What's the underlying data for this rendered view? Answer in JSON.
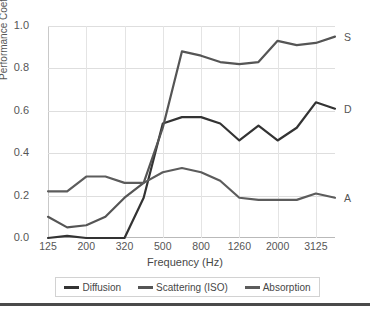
{
  "chart_data": {
    "type": "line",
    "title": "",
    "xlabel": "Frequency (Hz)",
    "ylabel": "Performance Coefficient",
    "ylim": [
      0.0,
      1.0
    ],
    "yticks": [
      "0.0",
      "0.2",
      "0.4",
      "0.6",
      "0.8",
      "1.0"
    ],
    "ytick_values": [
      0.0,
      0.2,
      0.4,
      0.6,
      0.8,
      1.0
    ],
    "xticks": [
      "125",
      "200",
      "320",
      "500",
      "800",
      "1260",
      "2000",
      "3125"
    ],
    "grid": "both",
    "legend_position": "bottom",
    "x": [
      125,
      160,
      200,
      250,
      320,
      400,
      500,
      630,
      800,
      1000,
      1260,
      1600,
      2000,
      2500,
      3125,
      4000
    ],
    "series": [
      {
        "name": "Diffusion",
        "end_label": "D",
        "color": "#333333",
        "values": [
          0.0,
          0.01,
          0.0,
          0.0,
          0.0,
          0.19,
          0.54,
          0.57,
          0.57,
          0.54,
          0.46,
          0.53,
          0.46,
          0.52,
          0.64,
          0.61
        ]
      },
      {
        "name": "Scattering (ISO)",
        "end_label": "S",
        "color": "#555555",
        "values": [
          0.1,
          0.05,
          0.06,
          0.1,
          0.19,
          0.26,
          0.52,
          0.88,
          0.86,
          0.83,
          0.82,
          0.83,
          0.93,
          0.91,
          0.92,
          0.95
        ]
      },
      {
        "name": "Absorption",
        "end_label": "A",
        "color": "#5c5c5c",
        "values": [
          0.22,
          0.22,
          0.29,
          0.29,
          0.26,
          0.26,
          0.31,
          0.33,
          0.31,
          0.27,
          0.19,
          0.18,
          0.18,
          0.18,
          0.21,
          0.19
        ]
      }
    ]
  },
  "legend": {
    "items": [
      {
        "label": "Diffusion"
      },
      {
        "label": "Scattering (ISO)"
      },
      {
        "label": "Absorption"
      }
    ]
  }
}
